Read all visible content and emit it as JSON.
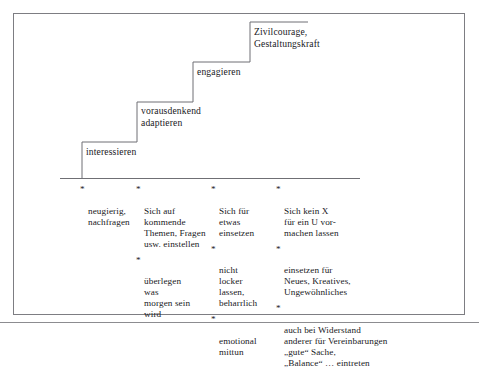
{
  "figure": {
    "staircase": {
      "steps": [
        {
          "label": "interessieren"
        },
        {
          "label": "vorausdenkend\nadaptieren"
        },
        {
          "label": "engagieren"
        },
        {
          "label": "Zivilcourage,\nGestaltungskraft"
        }
      ]
    },
    "columns": [
      {
        "name": "column-interessieren",
        "items": [
          {
            "marker": "*",
            "text": "neugierig,\nnachfragen"
          }
        ]
      },
      {
        "name": "column-vorausdenkend-adaptieren",
        "items": [
          {
            "marker": "*",
            "text": "Sich auf\nkommende\nThemen, Fragen\nusw. einstellen"
          },
          {
            "marker": "*",
            "text": "überlegen\nwas\nmorgen sein\nwird"
          }
        ]
      },
      {
        "name": "column-engagieren",
        "items": [
          {
            "marker": "*",
            "text": "Sich für\netwas\neinsetzen"
          },
          {
            "marker": "*",
            "text": "nicht\nlocker\nlassen,\nbeharrlich"
          },
          {
            "marker": "*",
            "text": "emotional\nmittun"
          }
        ]
      },
      {
        "name": "column-zivilcourage-gestaltungskraft",
        "items": [
          {
            "marker": "*",
            "text": "Sich kein X\nfür ein U vor-\nmachen lassen"
          },
          {
            "marker": "*",
            "text": "einsetzen für\nNeues, Kreatives,\nUngewöhnliches"
          },
          {
            "marker": "*",
            "text": "auch bei Widerstand\nanderer für Vereinbarungen\n„gute“ Sache,\n„Balance“ … eintreten"
          }
        ]
      }
    ],
    "colors": {
      "frame": "#7d7d82",
      "stair_line": "#6f6f74",
      "text": "#202024",
      "background": "#ffffff"
    }
  }
}
